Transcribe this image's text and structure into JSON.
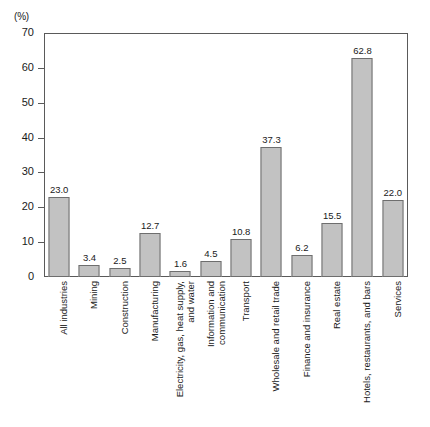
{
  "chart_data": {
    "type": "bar",
    "title": "",
    "subtitle": "",
    "xlabel": "",
    "ylabel": "",
    "unit_label": "(%)",
    "ylim": [
      0,
      70
    ],
    "ytick_values": [
      0,
      10,
      20,
      30,
      40,
      50,
      60,
      70
    ],
    "ytick_labels": [
      "0",
      "10",
      "20",
      "30",
      "40",
      "50",
      "60",
      "70"
    ],
    "grid": false,
    "legend": false,
    "legend_position": "none",
    "bar_fill_color": "#c2c2c2",
    "bar_edge_color": "#6e6e6e",
    "axis_color": "#5a5a5a",
    "categories": [
      "All industries",
      "Mining",
      "Construction",
      "Manufacturing",
      "Electricity, gas, heat supply, and water",
      "Information and communication",
      "Transport",
      "Wholesale and retail trade",
      "Finance and insurance",
      "Real estate",
      "Hotels, restaurants, and bars",
      "Services"
    ],
    "category_lines": [
      [
        "All industries"
      ],
      [
        "Mining"
      ],
      [
        "Construction"
      ],
      [
        "Manufacturing"
      ],
      [
        "Electricity, gas, heat supply,",
        "and water"
      ],
      [
        "Information and",
        "communication"
      ],
      [
        "Transport"
      ],
      [
        "Wholesale and retail trade"
      ],
      [
        "Finance and insurance"
      ],
      [
        "Real estate"
      ],
      [
        "Hotels, restaurants, and bars"
      ],
      [
        "Services"
      ]
    ],
    "values": [
      23.0,
      3.4,
      2.5,
      12.7,
      1.6,
      4.5,
      10.8,
      37.3,
      6.2,
      15.5,
      62.8,
      22.0
    ],
    "value_labels": [
      "23.0",
      "3.4",
      "2.5",
      "12.7",
      "1.6",
      "4.5",
      "10.8",
      "37.3",
      "6.2",
      "15.5",
      "62.8",
      "22.0"
    ]
  }
}
